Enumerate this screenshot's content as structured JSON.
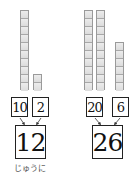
{
  "left": {
    "tens_rods": 1,
    "ones_cubes": 2,
    "tens_value": "10",
    "ones_value": "2",
    "total": "12",
    "caption": "じゅうに"
  },
  "right": {
    "tens_rods": 2,
    "ones_cubes": 6,
    "tens_value": "20",
    "ones_value": "6",
    "total": "26"
  },
  "colors": {
    "block_fill": "#e4e4e4",
    "block_border": "#9a9a9a",
    "box_border": "#222222",
    "text": "#111111"
  }
}
